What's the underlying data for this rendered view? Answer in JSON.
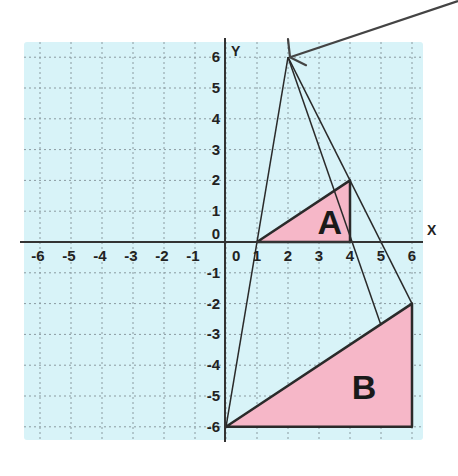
{
  "diagram": {
    "type": "coordinate-grid-enlargement",
    "colors": {
      "grid_background": "#d8f3f8",
      "grid_lines": "#8a9aa0",
      "shape_fill": "#f6b7c8",
      "lines": "#2a2a2a"
    },
    "axes": {
      "x_label": "X",
      "y_label": "Y",
      "x_ticks": [
        "-6",
        "-5",
        "-4",
        "-3",
        "-2",
        "-1",
        "0",
        "1",
        "2",
        "3",
        "4",
        "5",
        "6"
      ],
      "y_ticks": [
        "6",
        "5",
        "4",
        "3",
        "2",
        "1",
        "0",
        "-1",
        "-2",
        "-3",
        "-4",
        "-5",
        "-6"
      ],
      "x_range": [
        -6,
        6
      ],
      "y_range": [
        -6,
        6
      ]
    },
    "center_of_enlargement": [
      2,
      6
    ],
    "shapes": [
      {
        "label": "A",
        "vertices": [
          [
            1,
            0
          ],
          [
            4,
            2
          ],
          [
            4,
            0
          ]
        ]
      },
      {
        "label": "B",
        "vertices": [
          [
            0,
            -6
          ],
          [
            6,
            -2
          ],
          [
            6,
            -6
          ]
        ]
      }
    ],
    "rays": [
      {
        "from": [
          2,
          6
        ],
        "to": [
          0,
          -6
        ]
      },
      {
        "from": [
          2,
          6
        ],
        "to": [
          6,
          -2
        ]
      },
      {
        "from": [
          2,
          6
        ],
        "to": [
          5,
          -2.7
        ]
      }
    ],
    "arrow": {
      "from": [
        458,
        0
      ],
      "to": [
        2,
        6
      ],
      "description": "pointer to center of enlargement"
    }
  }
}
